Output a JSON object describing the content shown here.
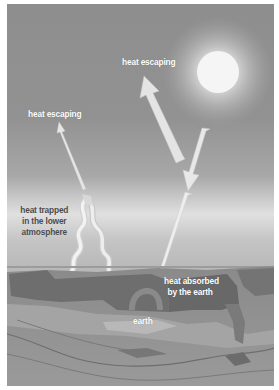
{
  "diagram": {
    "colors": {
      "sky_top": "#8a8a8a",
      "sky_horizon": "#d8d8d8",
      "sun": "#f4f4f4",
      "ground": "#8c8c8c",
      "arrow": "#e8e8e8"
    },
    "labels": {
      "heat_escaping_top": "heat escaping",
      "heat_escaping_left": "heat escaping",
      "heat_trapped_line1": "heat trapped",
      "heat_trapped_line2": "in the lower",
      "heat_trapped_line3": "atmosphere",
      "heat_absorbed_line1": "heat absorbed",
      "heat_absorbed_line2": "by the earth",
      "earth": "earth"
    },
    "icons": [
      "sun-icon",
      "arrow-icon",
      "wavy-arrow-icon"
    ]
  }
}
